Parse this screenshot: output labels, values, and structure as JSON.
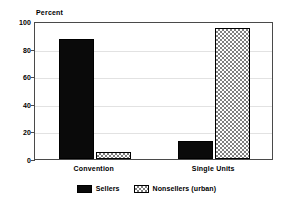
{
  "chart_data": {
    "type": "bar",
    "title": "",
    "subtitle": "",
    "xlabel": "",
    "ylabel": "Percent",
    "ylim": [
      0,
      100
    ],
    "yticks": [
      0,
      20,
      40,
      60,
      80,
      100
    ],
    "ytick_labels": [
      "0",
      "20",
      "40",
      "60",
      "80",
      "100"
    ],
    "grid": true,
    "grid_axis": "y",
    "legend_position": "bottom-center",
    "categories": [
      "Convention",
      "Single Units"
    ],
    "series": [
      {
        "name": "Sellers",
        "pattern": "solid",
        "color": "#0a0a0a",
        "values": [
          87,
          13
        ]
      },
      {
        "name": "Nonsellers (urban)",
        "pattern": "checkerboard",
        "color": "#808080",
        "values": [
          5,
          95
        ]
      }
    ]
  },
  "axis": {
    "y_title": "Percent"
  },
  "legend": {
    "items": [
      {
        "label": "Sellers"
      },
      {
        "label": "Nonsellers (urban)"
      }
    ]
  }
}
